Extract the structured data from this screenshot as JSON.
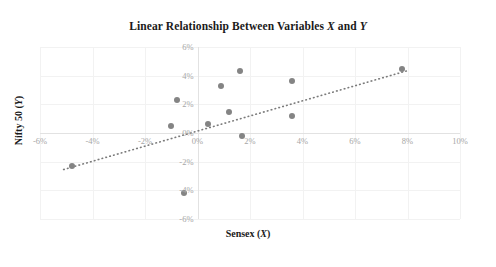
{
  "chart_data": {
    "type": "scatter",
    "title": "Linear Relationship Between Variables X and Y",
    "title_plain_prefix": "Linear Relationship Between Variables ",
    "title_var_x": "X",
    "title_conjunction": " and ",
    "title_var_y": "Y",
    "xlabel": "Sensex (X)",
    "xlabel_plain": "Sensex (",
    "xlabel_var": "X",
    "xlabel_close": ")",
    "ylabel": "Nifty 50 (Y)",
    "ylabel_plain": "Nifty 50 (",
    "ylabel_var": "Y",
    "ylabel_close": ")",
    "xlim": [
      -6,
      10
    ],
    "ylim": [
      -6,
      6
    ],
    "xticks": [
      -6,
      -4,
      -2,
      0,
      2,
      4,
      6,
      8,
      10
    ],
    "xtick_labels": [
      "-6%",
      "-4%",
      "-2%",
      "0%",
      "2%",
      "4%",
      "6%",
      "8%",
      "10%"
    ],
    "yticks": [
      6,
      4,
      2,
      0,
      -2,
      -4,
      -6
    ],
    "ytick_labels": [
      "6%",
      "4%",
      "2%",
      "0%",
      "-2%",
      "-4%",
      "-6%"
    ],
    "grid": true,
    "legend": false,
    "x": [
      -4.8,
      -1.0,
      -0.8,
      -0.5,
      0.4,
      0.9,
      1.2,
      1.6,
      1.7,
      3.6,
      3.6,
      7.8
    ],
    "y": [
      -2.3,
      0.5,
      2.3,
      -4.2,
      0.6,
      3.3,
      1.5,
      4.3,
      -0.2,
      3.6,
      1.2,
      4.5
    ],
    "points": [
      {
        "x": -4.8,
        "y": -2.3
      },
      {
        "x": -1.0,
        "y": 0.5
      },
      {
        "x": -0.8,
        "y": 2.3
      },
      {
        "x": -0.5,
        "y": -4.2
      },
      {
        "x": 0.4,
        "y": 0.6
      },
      {
        "x": 0.9,
        "y": 3.3
      },
      {
        "x": 1.2,
        "y": 1.5
      },
      {
        "x": 1.6,
        "y": 4.3
      },
      {
        "x": 1.7,
        "y": -0.2
      },
      {
        "x": 3.6,
        "y": 3.6
      },
      {
        "x": 3.6,
        "y": 1.2
      },
      {
        "x": 7.8,
        "y": 4.5
      }
    ],
    "trendline": {
      "style": "dotted",
      "x_start": -5.1,
      "y_start": -2.55,
      "x_end": 8.0,
      "y_end": 4.35
    },
    "colors": {
      "marker": "#848484",
      "trendline": "#7a7a7a",
      "grid": "#f2f2f2",
      "axis": "#e2e2e2",
      "tick_text": "#a6a6a6",
      "title_text": "#1a1a1a",
      "background": "#ffffff"
    }
  }
}
